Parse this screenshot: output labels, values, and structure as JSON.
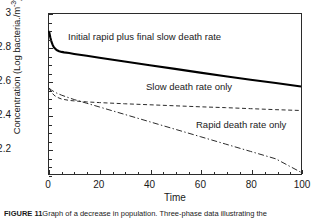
{
  "figure": {
    "caption_label": "FIGURE 11",
    "caption_text": "Graph of a decrease in population. Three-phase data illustrating the"
  },
  "chart_data": {
    "type": "line",
    "title": "",
    "xlabel": "Time",
    "ylabel": "Concentration (Log bacteria./m",
    "ylabel_exponent": "-3",
    "ylabel_close": ")",
    "xlim": [
      0,
      100
    ],
    "ylim": [
      2.05,
      3.0
    ],
    "xticks": [
      0,
      20,
      40,
      60,
      80,
      100
    ],
    "xtick_labels": [
      "0",
      "20",
      "40",
      "60",
      "80",
      "100"
    ],
    "yticks": [
      2.2,
      2.4,
      2.6,
      2.8,
      3.0
    ],
    "ytick_labels": [
      "2.2",
      "2.4",
      "2.6",
      "2.8",
      "3"
    ],
    "grid": false,
    "legend_position": "inline-annotations",
    "series": [
      {
        "name": "Initial rapid plus final slow death rate",
        "style": "solid",
        "color": "#000000",
        "width": 2.1,
        "annotation": "Initial rapid plus final slow death rate",
        "x": [
          0,
          0.5,
          1,
          1.5,
          2,
          3,
          4,
          5,
          6,
          8,
          10,
          15,
          20,
          30,
          40,
          50,
          60,
          70,
          80,
          90,
          100
        ],
        "y": [
          2.9,
          2.862,
          2.834,
          2.815,
          2.801,
          2.786,
          2.779,
          2.775,
          2.772,
          2.768,
          2.763,
          2.752,
          2.74,
          2.718,
          2.696,
          2.674,
          2.652,
          2.63,
          2.61,
          2.59,
          2.57
        ]
      },
      {
        "name": "Slow death rate only",
        "style": "dashed",
        "color": "#2b2b2b",
        "width": 1.0,
        "annotation": "Slow death rate only",
        "x": [
          0,
          1,
          2,
          3,
          5,
          8,
          10,
          15,
          20,
          30,
          40,
          50,
          60,
          70,
          80,
          90,
          100
        ],
        "y": [
          2.56,
          2.535,
          2.518,
          2.507,
          2.495,
          2.487,
          2.484,
          2.478,
          2.474,
          2.467,
          2.461,
          2.455,
          2.449,
          2.444,
          2.438,
          2.432,
          2.427
        ]
      },
      {
        "name": "Rapid death rate only",
        "style": "dashdot",
        "color": "#2b2b2b",
        "width": 1.0,
        "annotation": "Rapid death rate only",
        "x": [
          0,
          1,
          2,
          3,
          5,
          8,
          10,
          15,
          20,
          30,
          40,
          50,
          60,
          70,
          80,
          90,
          100
        ],
        "y": [
          2.56,
          2.548,
          2.539,
          2.531,
          2.518,
          2.502,
          2.492,
          2.47,
          2.448,
          2.404,
          2.36,
          2.316,
          2.272,
          2.228,
          2.184,
          2.14,
          2.06
        ]
      }
    ]
  }
}
